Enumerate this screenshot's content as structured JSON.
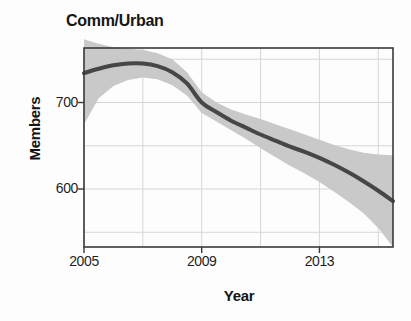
{
  "figure": {
    "background_color": "#fdfdfd",
    "title": "Comm/Urban"
  },
  "axes": {
    "x_title": "Year",
    "y_title": "Members",
    "x_tick_labels": [
      "2005",
      "2009",
      "2013"
    ],
    "y_tick_labels": [
      "700",
      "600"
    ],
    "frame_color": "#3a3a3a",
    "grid_color": "#d6d6d6"
  },
  "chart_data": {
    "type": "line",
    "title": "Comm/Urban",
    "xlabel": "Year",
    "ylabel": "Members",
    "xlim": [
      2005,
      2015.5
    ],
    "ylim": [
      533,
      763
    ],
    "grid": true,
    "legend": null,
    "x_ticks": [
      2005,
      2009,
      2013
    ],
    "x_gridlines": [
      2005,
      2007,
      2009,
      2011,
      2013,
      2015
    ],
    "y_ticks": [
      700,
      600
    ],
    "y_gridlines": [
      750,
      700,
      650,
      600,
      550
    ],
    "series": [
      {
        "name": "Comm/Urban trend",
        "kind": "line",
        "color": "#464646",
        "line_width": 4,
        "x": [
          2005.0,
          2005.5,
          2006.0,
          2006.5,
          2007.0,
          2007.5,
          2008.0,
          2008.5,
          2009.0,
          2009.5,
          2010.0,
          2010.5,
          2011.0,
          2011.5,
          2012.0,
          2012.5,
          2013.0,
          2013.5,
          2014.0,
          2014.5,
          2015.0,
          2015.5
        ],
        "values": [
          734,
          739,
          743,
          745,
          745,
          742,
          735,
          722,
          700,
          689,
          679,
          671,
          663,
          656,
          649,
          643,
          636,
          628,
          619,
          609,
          598,
          586
        ]
      },
      {
        "name": "Confidence band",
        "kind": "band",
        "color": "#c9c9c9",
        "x": [
          2005.0,
          2005.5,
          2006.0,
          2006.5,
          2007.0,
          2007.5,
          2008.0,
          2008.5,
          2009.0,
          2009.5,
          2010.0,
          2010.5,
          2011.0,
          2011.5,
          2012.0,
          2012.5,
          2013.0,
          2013.5,
          2014.0,
          2014.5,
          2015.0,
          2015.5
        ],
        "upper": [
          773,
          768,
          764,
          762,
          761,
          757,
          750,
          735,
          712,
          700,
          692,
          686,
          681,
          675,
          669,
          663,
          657,
          651,
          646,
          642,
          640,
          639
        ],
        "lower": [
          675,
          705,
          719,
          726,
          729,
          727,
          720,
          708,
          688,
          678,
          668,
          658,
          647,
          637,
          627,
          618,
          608,
          597,
          585,
          572,
          555,
          533
        ]
      }
    ]
  }
}
